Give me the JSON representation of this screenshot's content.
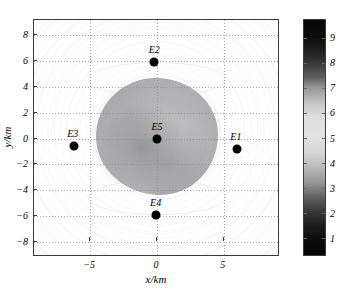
{
  "figure": {
    "type": "pseudocolor-contour-map",
    "header_fragments": [
      "",
      "",
      ""
    ]
  },
  "axes": {
    "xlabel": "x/km",
    "ylabel": "y/km",
    "xticks": [
      -5,
      0,
      5
    ],
    "xtick_labels": [
      "−5",
      "0",
      "5"
    ],
    "yticks": [
      8,
      6,
      4,
      2,
      0,
      -2,
      -4,
      -6,
      -8
    ],
    "ytick_labels": [
      "8",
      "6",
      "4",
      "2",
      "0",
      "−2",
      "−4",
      "−6",
      "−8"
    ],
    "xlim": [
      -9.2,
      9.2
    ],
    "ylim": [
      -9.2,
      9.2
    ],
    "grid": "dotted",
    "grid_color": "#8d8d8d",
    "box_color": "#3b3b3b"
  },
  "colorbar": {
    "ticks": [
      1,
      2,
      3,
      4,
      5,
      6,
      7,
      8,
      9
    ],
    "tick_labels": [
      "1",
      "2",
      "3",
      "4",
      "5",
      "6",
      "7",
      "8",
      "9"
    ],
    "range": [
      0.3,
      9.7
    ],
    "colormap": "greyscale-nonmonotonic",
    "position": "right"
  },
  "stations": [
    {
      "name": "E1",
      "x": 6.0,
      "y": -0.8,
      "label_dx": -0.1,
      "label_dy": 1.15
    },
    {
      "name": "E2",
      "x": -0.2,
      "y": 5.95,
      "label_dx": 0.0,
      "label_dy": 1.2
    },
    {
      "name": "E3",
      "x": -6.2,
      "y": -0.6,
      "label_dx": -0.1,
      "label_dy": 1.2
    },
    {
      "name": "E4",
      "x": -0.1,
      "y": -5.95,
      "label_dx": 0.0,
      "label_dy": 1.2
    },
    {
      "name": "E5",
      "x": 0.0,
      "y": 0.0,
      "label_dx": 0.0,
      "label_dy": 1.2
    }
  ],
  "chart_data": {
    "type": "heatmap",
    "title": "",
    "xlabel": "x/km",
    "ylabel": "y/km",
    "xlim": [
      -9.2,
      9.2
    ],
    "ylim": [
      -9.2,
      9.2
    ],
    "grid": true,
    "legend": "colorbar-right",
    "colorbar_range": [
      0.3,
      9.7
    ],
    "colorbar_ticks": [
      1,
      2,
      3,
      4,
      5,
      6,
      7,
      8,
      9
    ],
    "annotations": [
      {
        "text": "E1",
        "x": 6.0,
        "y": -0.8
      },
      {
        "text": "E2",
        "x": -0.2,
        "y": 5.95
      },
      {
        "text": "E3",
        "x": -6.2,
        "y": -0.6
      },
      {
        "text": "E4",
        "x": -0.1,
        "y": -5.95
      },
      {
        "text": "E5",
        "x": 0.0,
        "y": 0.0
      }
    ],
    "features": [
      {
        "name": "central-anomaly-core",
        "center": [
          0,
          0.3
        ],
        "radius_km": 3.2,
        "value": 4.0
      },
      {
        "name": "bright-annulus",
        "center": [
          0,
          0.3
        ],
        "radius_km": 5.0,
        "value": 5.8
      },
      {
        "name": "far-field-background",
        "center": [
          0,
          0.3
        ],
        "radius_km": 9.0,
        "value": 4.5
      }
    ],
    "value_samples": {
      "center": 4.0,
      "core_edge": 4.3,
      "bright_ring": 5.9,
      "mid_field": 5.4,
      "corner": 4.4
    }
  }
}
